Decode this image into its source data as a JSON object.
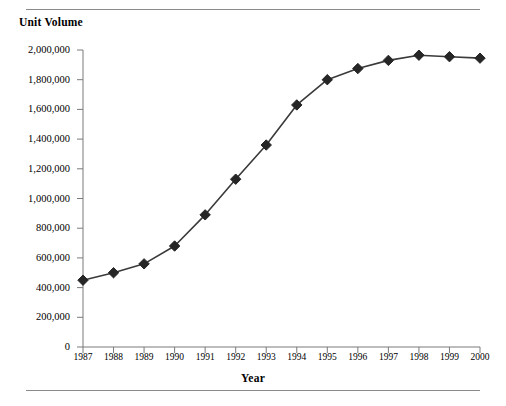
{
  "chart_data": {
    "type": "line",
    "title": "",
    "xlabel": "Year",
    "ylabel": "Unit Volume",
    "categories": [
      "1987",
      "1988",
      "1989",
      "1990",
      "1991",
      "1992",
      "1993",
      "1994",
      "1995",
      "1996",
      "1997",
      "1998",
      "1999",
      "2000"
    ],
    "x": [
      1987,
      1988,
      1989,
      1990,
      1991,
      1992,
      1993,
      1994,
      1995,
      1996,
      1997,
      1998,
      1999,
      2000
    ],
    "values": [
      450000,
      500000,
      560000,
      680000,
      890000,
      1130000,
      1360000,
      1630000,
      1800000,
      1875000,
      1930000,
      1965000,
      1955000,
      1945000
    ],
    "series": [
      {
        "name": "Unit Volume",
        "values": [
          450000,
          500000,
          560000,
          680000,
          890000,
          1130000,
          1360000,
          1630000,
          1800000,
          1875000,
          1930000,
          1965000,
          1955000,
          1945000
        ]
      }
    ],
    "ylim": [
      0,
      2000000
    ],
    "ytick_values": [
      0,
      200000,
      400000,
      600000,
      800000,
      1000000,
      1200000,
      1400000,
      1600000,
      1800000,
      2000000
    ],
    "ytick_labels": [
      "0",
      "200,000",
      "400,000",
      "600,000",
      "800,000",
      "1,000,000",
      "1,200,000",
      "1,400,000",
      "1,600,000",
      "1,800,000",
      "2,000,000"
    ],
    "xlim": [
      1987,
      2000
    ],
    "grid": false,
    "legend": false,
    "legend_position": "none",
    "marker": "diamond",
    "marker_color": "#262626",
    "line_color": "#3a3a3a",
    "axis_color": "#7a7a7a",
    "annotations": []
  },
  "figure": {
    "y_axis_title": "Unit Volume",
    "x_axis_title": "Year"
  },
  "colors": {
    "background": "#ffffff",
    "rule": "#8a8a8a",
    "text": "#000000",
    "marker": "#262626",
    "line": "#3a3a3a",
    "axis": "#7a7a7a"
  }
}
